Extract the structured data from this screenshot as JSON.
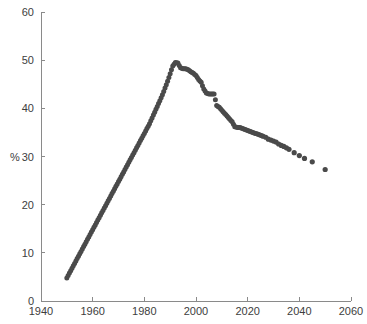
{
  "chart": {
    "type": "scatter",
    "title": "",
    "ylabel": "%",
    "xlabel": "",
    "marker_color": "#4a4a4a",
    "axis_color": "#8a8a8a",
    "grid": "off",
    "legend": "none"
  },
  "axes": {
    "x": {
      "min": 1940,
      "max": 2060,
      "tick_labels": [
        "1940",
        "1960",
        "1980",
        "2000",
        "2020",
        "2040",
        "2060"
      ],
      "tick_values": [
        1940,
        1960,
        1980,
        2000,
        2020,
        2040,
        2060
      ]
    },
    "y": {
      "min": 0,
      "max": 60,
      "label": "%",
      "tick_labels": [
        "0",
        "10",
        "20",
        "30",
        "40",
        "50",
        "60"
      ],
      "tick_values": [
        0,
        10,
        20,
        30,
        40,
        50,
        60
      ]
    }
  },
  "chart_data": {
    "type": "scatter",
    "title": "",
    "xlabel": "",
    "ylabel": "%",
    "xlim": [
      1940,
      2060
    ],
    "ylim": [
      0,
      60
    ],
    "grid": false,
    "legend_position": "none",
    "marker_color": "#4a4a4a",
    "series": [
      {
        "name": "percent",
        "x": [
          1950,
          1951,
          1952,
          1953,
          1954,
          1955,
          1956,
          1957,
          1958,
          1959,
          1960,
          1961,
          1962,
          1963,
          1964,
          1965,
          1966,
          1967,
          1968,
          1969,
          1970,
          1971,
          1972,
          1973,
          1974,
          1975,
          1976,
          1977,
          1978,
          1979,
          1980,
          1981,
          1982,
          1983,
          1984,
          1985,
          1986,
          1987,
          1988,
          1989,
          1990,
          1991,
          1992,
          1993,
          1994,
          1995,
          1996,
          1997,
          1998,
          1999,
          2000,
          2001,
          2002,
          2003,
          2004,
          2005,
          2006,
          2007,
          2008,
          2009,
          2010,
          2011,
          2012,
          2013,
          2014,
          2015,
          2016,
          2017,
          2018,
          2019,
          2020,
          2021,
          2022,
          2023,
          2024,
          2025,
          2026,
          2027,
          2028,
          2029,
          2030,
          2031,
          2032,
          2033,
          2034,
          2035,
          2036,
          2038,
          2040,
          2042,
          2045,
          2050
        ],
        "y": [
          4.8,
          5.8,
          6.8,
          7.8,
          8.8,
          9.8,
          10.8,
          11.8,
          12.8,
          13.8,
          14.8,
          15.8,
          16.8,
          17.8,
          18.8,
          19.8,
          20.8,
          21.8,
          22.8,
          23.8,
          24.8,
          25.8,
          26.8,
          27.8,
          28.8,
          29.8,
          30.8,
          31.8,
          32.8,
          33.8,
          34.8,
          35.8,
          36.8,
          38.0,
          39.2,
          40.4,
          41.6,
          42.8,
          44.2,
          45.6,
          47.2,
          48.8,
          49.5,
          49.4,
          48.4,
          48.2,
          48.2,
          48.0,
          47.6,
          47.3,
          46.8,
          46.0,
          45.4,
          44.0,
          43.2,
          43.0,
          43.0,
          43.0,
          40.6,
          40.2,
          39.6,
          39.0,
          38.4,
          37.8,
          37.2,
          36.2,
          36.0,
          36.0,
          35.8,
          35.6,
          35.4,
          35.2,
          35.0,
          34.8,
          34.6,
          34.4,
          34.2,
          34.0,
          33.6,
          33.4,
          33.2,
          33.0,
          32.6,
          32.3,
          32.1,
          31.8,
          31.5,
          30.8,
          30.2,
          29.6,
          28.9,
          27.3
        ]
      }
    ]
  }
}
